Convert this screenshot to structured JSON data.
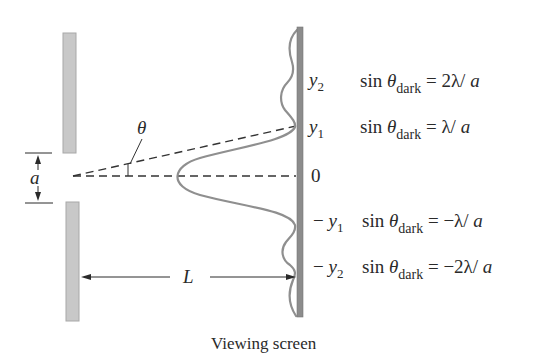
{
  "figure": {
    "caption": "Viewing screen",
    "colors": {
      "barrier_fill": "#c8c8c8",
      "barrier_edge": "#a8a8a8",
      "screen": "#8c8c8c",
      "intensity_curve": "#8f8f8f",
      "dashed_lines": "#333333",
      "text": "#2a2a2a"
    },
    "symbols": {
      "slit_width": "a",
      "angle": "θ",
      "distance": "L"
    },
    "screen_labels": [
      {
        "sign": "",
        "var": "y",
        "sub": "2"
      },
      {
        "sign": "",
        "var": "y",
        "sub": "1"
      },
      {
        "sign": "",
        "var": "0",
        "sub": ""
      },
      {
        "sign": "− ",
        "var": "y",
        "sub": "1"
      },
      {
        "sign": "− ",
        "var": "y",
        "sub": "2"
      }
    ],
    "equations": [
      {
        "lhs": "sin ",
        "theta": "θ",
        "sub": "dark",
        "rhs": " = 2λ/ ",
        "a": "a"
      },
      {
        "lhs": "sin ",
        "theta": "θ",
        "sub": "dark",
        "rhs": " = λ/ ",
        "a": "a"
      },
      {
        "lhs": "sin ",
        "theta": "θ",
        "sub": "dark",
        "rhs": " = −λ/ ",
        "a": "a"
      },
      {
        "lhs": "sin ",
        "theta": "θ",
        "sub": "dark",
        "rhs": " = −2λ/ ",
        "a": "a"
      }
    ]
  }
}
